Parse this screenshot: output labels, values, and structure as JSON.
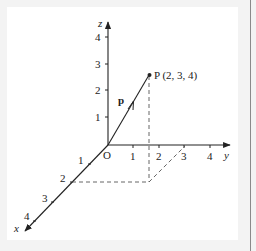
{
  "diagram": {
    "colors": {
      "line": "#222222",
      "dashed": "#555555",
      "background": "#f3f3f3",
      "panel": "#ffffff",
      "edge": "#8a8a8a"
    },
    "axes": {
      "x": {
        "label": "x",
        "ticks": [
          "1",
          "2",
          "3",
          "4"
        ]
      },
      "y": {
        "label": "y",
        "ticks": [
          "1",
          "2",
          "3",
          "4"
        ]
      },
      "z": {
        "label": "z",
        "ticks": [
          "1",
          "2",
          "3",
          "4"
        ]
      }
    },
    "origin_label": "O",
    "vector": {
      "label": "p"
    },
    "point": {
      "label": "P (2, 3, 4)",
      "coordinates": [
        2,
        3,
        4
      ]
    }
  }
}
